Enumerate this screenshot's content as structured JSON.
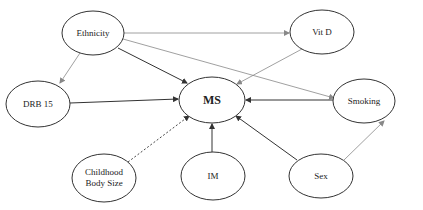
{
  "diagram": {
    "type": "causal-dag",
    "nodes": [
      {
        "id": "ethnicity",
        "label": "Ethnicity",
        "cx": 93,
        "cy": 33,
        "rx": 31,
        "ry": 22
      },
      {
        "id": "vitd",
        "label": "Vit D",
        "cx": 322,
        "cy": 32,
        "rx": 32,
        "ry": 22
      },
      {
        "id": "ms",
        "label": "MS",
        "cx": 212,
        "cy": 100,
        "rx": 33,
        "ry": 23
      },
      {
        "id": "drb15",
        "label": "DRB 15",
        "cx": 38,
        "cy": 104,
        "rx": 32,
        "ry": 23
      },
      {
        "id": "smoking",
        "label": "Smoking",
        "cx": 364,
        "cy": 101,
        "rx": 31,
        "ry": 22
      },
      {
        "id": "childhood",
        "label_line1": "Childhood",
        "label_line2": "Body Size",
        "cx": 104,
        "cy": 178,
        "rx": 32,
        "ry": 24
      },
      {
        "id": "im",
        "label": "IM",
        "cx": 213,
        "cy": 176,
        "rx": 32,
        "ry": 24
      },
      {
        "id": "sex",
        "label": "Sex",
        "cx": 321,
        "cy": 176,
        "rx": 32,
        "ry": 22
      }
    ],
    "edges": [
      {
        "from": "Ethnicity",
        "to": "Vit D",
        "style": "light"
      },
      {
        "from": "Ethnicity",
        "to": "MS",
        "style": "dark"
      },
      {
        "from": "Ethnicity",
        "to": "DRB 15",
        "style": "light"
      },
      {
        "from": "Ethnicity",
        "to": "Smoking",
        "style": "light"
      },
      {
        "from": "Vit D",
        "to": "MS",
        "style": "light"
      },
      {
        "from": "DRB 15",
        "to": "MS",
        "style": "dark"
      },
      {
        "from": "Smoking",
        "to": "MS",
        "style": "dark"
      },
      {
        "from": "Childhood Body Size",
        "to": "MS",
        "style": "dashed"
      },
      {
        "from": "IM",
        "to": "MS",
        "style": "dark"
      },
      {
        "from": "Sex",
        "to": "MS",
        "style": "dark"
      },
      {
        "from": "Sex",
        "to": "Smoking",
        "style": "light"
      }
    ]
  }
}
